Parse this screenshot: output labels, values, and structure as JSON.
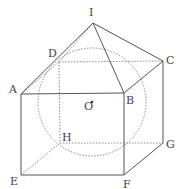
{
  "figure": {
    "type": "geometry-diagram",
    "colors": {
      "solid_line": "#555555",
      "dashed_line": "#8a8a8a",
      "label": "#444444",
      "background": "#ffffff"
    },
    "points": {
      "I": {
        "label": "I",
        "x": 93,
        "y": 23,
        "lx": 89,
        "ly": 7
      },
      "D": {
        "label": "D",
        "x": 59,
        "y": 62,
        "lx": 48,
        "ly": 48
      },
      "C": {
        "label": "C",
        "x": 163,
        "y": 61,
        "lx": 166,
        "ly": 55
      },
      "A": {
        "label": "A",
        "x": 21,
        "y": 94,
        "lx": 9,
        "ly": 84
      },
      "B": {
        "label": "B",
        "x": 124,
        "y": 93,
        "lx": 126,
        "ly": 95
      },
      "O": {
        "label": "O",
        "x": 92,
        "y": 102,
        "lx": 84,
        "ly": 101
      },
      "H": {
        "label": "H",
        "x": 60,
        "y": 143,
        "lx": 62,
        "ly": 132
      },
      "G": {
        "label": "G",
        "x": 163,
        "y": 143,
        "lx": 166,
        "ly": 139
      },
      "E": {
        "label": "E",
        "x": 21,
        "y": 175,
        "lx": 10,
        "ly": 176
      },
      "F": {
        "label": "F",
        "x": 124,
        "y": 175,
        "lx": 123,
        "ly": 179
      }
    },
    "solid_edges": [
      [
        "A",
        "I"
      ],
      [
        "I",
        "B"
      ],
      [
        "I",
        "C"
      ],
      [
        "A",
        "B"
      ],
      [
        "B",
        "C"
      ],
      [
        "A",
        "E"
      ],
      [
        "B",
        "F"
      ],
      [
        "C",
        "G"
      ],
      [
        "E",
        "F"
      ],
      [
        "F",
        "G"
      ]
    ],
    "dashed_edges": [
      [
        "A",
        "D"
      ],
      [
        "D",
        "I"
      ],
      [
        "D",
        "C"
      ],
      [
        "D",
        "H"
      ],
      [
        "H",
        "G"
      ],
      [
        "E",
        "H"
      ]
    ],
    "sphere": {
      "cx": 92,
      "cy": 102,
      "r": 54,
      "style": "dashed"
    }
  }
}
